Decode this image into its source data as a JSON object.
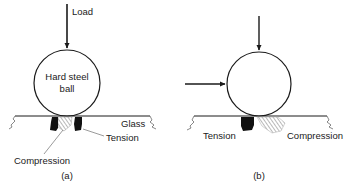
{
  "panel_a": {
    "load_label": "Load",
    "ball_label_line1": "Hard steel",
    "ball_label_line2": "ball",
    "glass_label": "Glass",
    "tension_label": "Tension",
    "compression_label": "Compression",
    "caption": "(a)"
  },
  "panel_b": {
    "tension_label": "Tension",
    "compression_label": "Compression",
    "caption": "(b)"
  },
  "colors": {
    "ink": "#1a1a1a",
    "tension_fill": "#111111",
    "hatch": "#888888"
  }
}
